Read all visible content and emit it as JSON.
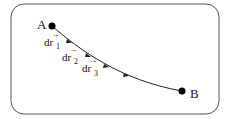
{
  "diagram": {
    "frame": {
      "stroke": "#555555"
    },
    "path": {
      "stroke": "#222222"
    },
    "points": [
      {
        "label": "A",
        "x": 52,
        "y": 26
      },
      {
        "label": "B",
        "x": 182,
        "y": 91
      }
    ],
    "segments": [
      {
        "label": "dr",
        "subscript": "1",
        "vector": true
      },
      {
        "label": "dr",
        "subscript": "2",
        "vector": true
      },
      {
        "label": "dr",
        "subscript": "3",
        "vector": true
      }
    ],
    "text": {
      "point_a": "A",
      "point_b": "B",
      "seg1_main": "dr",
      "seg1_sub": "1",
      "seg2_main": "dr",
      "seg2_sub": "2",
      "seg3_main": "dr",
      "seg3_sub": "3",
      "vector_arrow": "→"
    }
  }
}
